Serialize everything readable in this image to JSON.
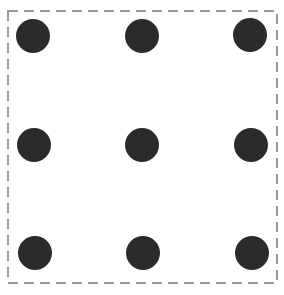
{
  "diagram": {
    "type": "nine-dot-grid",
    "frame": {
      "style": "dashed",
      "color": "#9a9a9a",
      "x": 8,
      "y": 11,
      "width": 269,
      "height": 272,
      "dash": [
        10,
        6
      ],
      "stroke_width": 2
    },
    "dot_color": "#2b2b2b",
    "dot_radius": 17,
    "rows": 3,
    "cols": 3,
    "dots": [
      {
        "row": 0,
        "col": 0,
        "cx": 33,
        "cy": 36
      },
      {
        "row": 0,
        "col": 1,
        "cx": 142,
        "cy": 36
      },
      {
        "row": 0,
        "col": 2,
        "cx": 250,
        "cy": 35
      },
      {
        "row": 1,
        "col": 0,
        "cx": 34,
        "cy": 145
      },
      {
        "row": 1,
        "col": 1,
        "cx": 142,
        "cy": 145
      },
      {
        "row": 1,
        "col": 2,
        "cx": 251,
        "cy": 145
      },
      {
        "row": 2,
        "col": 0,
        "cx": 35,
        "cy": 253
      },
      {
        "row": 2,
        "col": 1,
        "cx": 143,
        "cy": 253
      },
      {
        "row": 2,
        "col": 2,
        "cx": 252,
        "cy": 253
      }
    ]
  }
}
